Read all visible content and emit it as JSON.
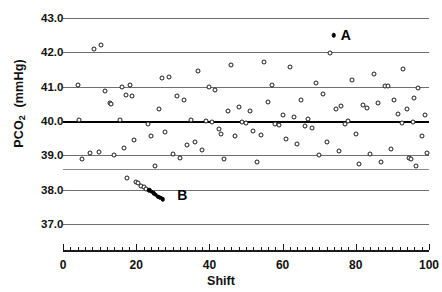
{
  "chart_data": {
    "type": "scatter",
    "title": "",
    "xlabel": "Shift",
    "ylabel": "PCO2  (mmHg)",
    "ylabel_main": "PCO",
    "ylabel_sub": "2",
    "ylabel_units": "(mmHg)",
    "xlim": [
      0,
      100
    ],
    "ylim": [
      36.6,
      43.2
    ],
    "grid": true,
    "legend": "none",
    "y_ticks": [
      37.0,
      38.0,
      39.0,
      40.0,
      41.0,
      42.0,
      43.0
    ],
    "y_tick_labels": [
      "37.0",
      "38.0",
      "39.0",
      "40.0",
      "41.0",
      "42.0",
      "43.0"
    ],
    "y_gridlines": [
      37.0,
      38.0,
      38.6,
      39.0,
      40.0,
      41.0,
      42.0,
      43.0
    ],
    "y_bold_line": 40.0,
    "x_ticks_major": [
      0,
      20,
      40,
      60,
      80,
      100
    ],
    "x_tick_labels": [
      "0",
      "20",
      "40",
      "60",
      "80",
      "100"
    ],
    "x_minor_step": 2,
    "annotations": [
      {
        "label": "A",
        "x": 74,
        "y": 42.5,
        "marker": "filled",
        "label_dx": 7
      },
      {
        "label": "B",
        "x": 29,
        "y": 37.85,
        "marker": "none",
        "label_dx": 8
      }
    ],
    "series": [
      {
        "name": "open-circles",
        "marker": "open",
        "points": [
          [
            4.2,
            41.05
          ],
          [
            4.5,
            40.03
          ],
          [
            5.2,
            38.9
          ],
          [
            7.5,
            39.08
          ],
          [
            8.5,
            42.1
          ],
          [
            9.8,
            39.1
          ],
          [
            10.3,
            42.2
          ],
          [
            11.5,
            40.88
          ],
          [
            12.8,
            40.52
          ],
          [
            13.2,
            40.5
          ],
          [
            14.0,
            39.02
          ],
          [
            15.5,
            40.02
          ],
          [
            16.0,
            40.98
          ],
          [
            16.6,
            39.22
          ],
          [
            17.2,
            40.75
          ],
          [
            17.6,
            38.35
          ],
          [
            18.3,
            41.05
          ],
          [
            18.8,
            40.72
          ],
          [
            19.5,
            39.45
          ],
          [
            20.0,
            38.22
          ],
          [
            20.5,
            38.18
          ],
          [
            21.3,
            38.12
          ],
          [
            22.0,
            38.08
          ],
          [
            22.6,
            38.02
          ],
          [
            23.2,
            39.92
          ],
          [
            24.0,
            39.55
          ],
          [
            25.0,
            38.7
          ],
          [
            26.2,
            40.35
          ],
          [
            27.0,
            41.25
          ],
          [
            28.0,
            39.68
          ],
          [
            29.0,
            41.28
          ],
          [
            30.0,
            39.05
          ],
          [
            31.2,
            40.72
          ],
          [
            32.0,
            38.92
          ],
          [
            33.0,
            40.6
          ],
          [
            34.0,
            39.3
          ],
          [
            35.0,
            40.02
          ],
          [
            36.0,
            39.4
          ],
          [
            37.0,
            41.45
          ],
          [
            38.0,
            39.15
          ],
          [
            39.0,
            40.0
          ],
          [
            40.0,
            41.0
          ],
          [
            40.8,
            39.98
          ],
          [
            41.5,
            40.9
          ],
          [
            42.5,
            39.78
          ],
          [
            43.2,
            39.62
          ],
          [
            44.0,
            38.88
          ],
          [
            45.0,
            40.3
          ],
          [
            46.0,
            41.62
          ],
          [
            47.0,
            39.55
          ],
          [
            48.0,
            40.42
          ],
          [
            49.0,
            39.98
          ],
          [
            50.0,
            39.95
          ],
          [
            51.0,
            40.28
          ],
          [
            52.0,
            39.7
          ],
          [
            53.0,
            38.8
          ],
          [
            54.0,
            39.6
          ],
          [
            55.0,
            41.72
          ],
          [
            56.0,
            40.55
          ],
          [
            57.0,
            41.05
          ],
          [
            58.0,
            39.92
          ],
          [
            59.0,
            39.88
          ],
          [
            60.0,
            40.18
          ],
          [
            61.0,
            39.48
          ],
          [
            62.0,
            41.58
          ],
          [
            63.0,
            40.12
          ],
          [
            64.0,
            39.32
          ],
          [
            65.0,
            40.62
          ],
          [
            66.0,
            39.85
          ],
          [
            67.0,
            40.05
          ],
          [
            68.0,
            39.8
          ],
          [
            69.0,
            41.1
          ],
          [
            70.0,
            39.0
          ],
          [
            71.0,
            40.8
          ],
          [
            72.0,
            39.4
          ],
          [
            73.0,
            41.98
          ],
          [
            74.5,
            40.35
          ],
          [
            75.5,
            39.12
          ],
          [
            76.0,
            40.45
          ],
          [
            77.0,
            39.92
          ],
          [
            78.0,
            40.0
          ],
          [
            79.0,
            41.2
          ],
          [
            80.0,
            39.62
          ],
          [
            81.0,
            38.75
          ],
          [
            82.0,
            40.48
          ],
          [
            83.0,
            40.38
          ],
          [
            84.0,
            39.05
          ],
          [
            85.0,
            41.38
          ],
          [
            86.0,
            40.52
          ],
          [
            87.0,
            38.8
          ],
          [
            88.0,
            41.02
          ],
          [
            88.8,
            41.02
          ],
          [
            89.5,
            39.18
          ],
          [
            90.5,
            40.62
          ],
          [
            91.5,
            40.2
          ],
          [
            92.5,
            39.95
          ],
          [
            93.0,
            41.52
          ],
          [
            94.0,
            40.35
          ],
          [
            94.6,
            38.92
          ],
          [
            95.0,
            38.88
          ],
          [
            95.5,
            39.98
          ],
          [
            96.0,
            40.68
          ],
          [
            96.5,
            38.7
          ],
          [
            97.0,
            40.95
          ],
          [
            98.0,
            39.55
          ],
          [
            99.0,
            40.18
          ],
          [
            99.5,
            39.08
          ]
        ]
      },
      {
        "name": "filled-circles-run-B",
        "marker": "filled",
        "points": [
          [
            23.6,
            37.98
          ],
          [
            24.2,
            37.94
          ],
          [
            24.8,
            37.9
          ],
          [
            25.4,
            37.85
          ],
          [
            26.0,
            37.8
          ],
          [
            26.6,
            37.76
          ],
          [
            27.2,
            37.72
          ]
        ]
      },
      {
        "name": "filled-circle-A",
        "marker": "filled",
        "points": [
          [
            74.0,
            42.5
          ]
        ]
      }
    ]
  }
}
